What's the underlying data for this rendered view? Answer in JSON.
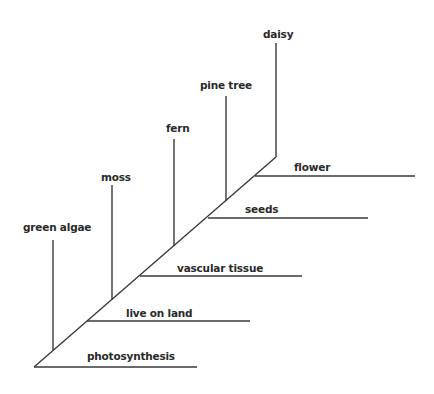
{
  "diagram": {
    "type": "cladogram",
    "line_color": "#3a3a3a",
    "organisms": [
      {
        "name": "green algae",
        "label_x": 23,
        "label_y": 222
      },
      {
        "name": "moss",
        "label_x": 101,
        "label_y": 172
      },
      {
        "name": "fern",
        "label_x": 166,
        "label_y": 123
      },
      {
        "name": "pine tree",
        "label_x": 200,
        "label_y": 80
      },
      {
        "name": "daisy",
        "label_x": 263,
        "label_y": 29
      }
    ],
    "traits": [
      {
        "name": "photosynthesis",
        "label_x": 87,
        "label_y": 351
      },
      {
        "name": "live on land",
        "label_x": 126,
        "label_y": 308
      },
      {
        "name": "vascular tissue",
        "label_x": 177,
        "label_y": 263
      },
      {
        "name": "seeds",
        "label_x": 245,
        "label_y": 204
      },
      {
        "name": "flower",
        "label_x": 294,
        "label_y": 162
      }
    ]
  }
}
